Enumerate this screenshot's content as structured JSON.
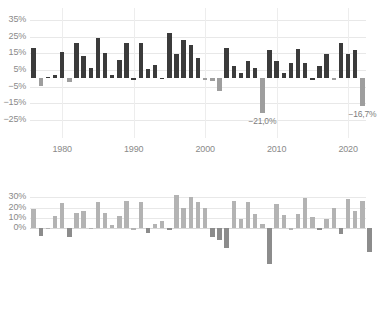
{
  "chart_data": [
    {
      "id": "top",
      "type": "bar",
      "title": "",
      "xlabel": "",
      "ylabel": "",
      "ylim": [
        -25,
        35
      ],
      "grid": true,
      "legend": null,
      "yticks": [
        "35%",
        "25%",
        "15%",
        "5%",
        "-5%",
        "-15%",
        "-25%"
      ],
      "ytick_values": [
        35,
        25,
        15,
        5,
        -5,
        -15,
        -25
      ],
      "xticks": [
        "1980",
        "1990",
        "2000",
        "2010",
        "2020"
      ],
      "xtick_values": [
        1980,
        1990,
        2000,
        2010,
        2020
      ],
      "positive_color": "#3b3b3b",
      "negative_color": "#9e9e9e",
      "categories": [
        1976,
        1977,
        1978,
        1979,
        1980,
        1981,
        1982,
        1983,
        1984,
        1985,
        1986,
        1987,
        1988,
        1989,
        1990,
        1991,
        1992,
        1993,
        1994,
        1995,
        1996,
        1997,
        1998,
        1999,
        2000,
        2001,
        2002,
        2003,
        2004,
        2005,
        2006,
        2007,
        2008,
        2009,
        2010,
        2011,
        2012,
        2013,
        2014,
        2015,
        2016,
        2017,
        2018,
        2019,
        2020,
        2021,
        2022
      ],
      "values": [
        18.0,
        -4.5,
        1.0,
        2.0,
        16.0,
        -2.5,
        21.5,
        13.5,
        6.5,
        24.5,
        15.0,
        2.0,
        11.0,
        21.5,
        0.0,
        21.5,
        5.5,
        8.0,
        0.5,
        27.5,
        14.5,
        23.0,
        20.0,
        12.0,
        -0.5,
        -1.5,
        -7.5,
        18.0,
        7.5,
        3.5,
        10.5,
        6.0,
        -21.0,
        17.0,
        10.5,
        3.5,
        9.5,
        17.5,
        9.5,
        0.0,
        7.5,
        14.5,
        -0.5,
        21.5,
        14.5,
        17.0,
        -16.7
      ],
      "annotations": [
        {
          "text": "-21,0%",
          "category": 2008,
          "value": -21.0
        },
        {
          "text": "-16,7%",
          "category": 2022,
          "value": -16.7
        }
      ]
    },
    {
      "id": "bottom",
      "type": "bar",
      "title": "",
      "xlabel": "",
      "ylabel": "",
      "ylim": [
        -40,
        35
      ],
      "grid": true,
      "legend": null,
      "yticks": [
        "30%",
        "20%",
        "10%",
        "0%"
      ],
      "ytick_values": [
        30,
        20,
        10,
        0
      ],
      "xticks": [],
      "xtick_values": [],
      "positive_color": "#b3b3b3",
      "negative_color": "#8c8c8c",
      "categories": [
        1976,
        1977,
        1978,
        1979,
        1980,
        1981,
        1982,
        1983,
        1984,
        1985,
        1986,
        1987,
        1988,
        1989,
        1990,
        1991,
        1992,
        1993,
        1994,
        1995,
        1996,
        1997,
        1998,
        1999,
        2000,
        2001,
        2002,
        2003,
        2004,
        2005,
        2006,
        2007,
        2008,
        2009,
        2010,
        2011,
        2012,
        2013,
        2014,
        2015,
        2016,
        2017,
        2018,
        2019,
        2020,
        2021,
        2022
      ],
      "values": [
        19.0,
        -7.5,
        0.5,
        11.5,
        24.5,
        -8.0,
        15.0,
        16.5,
        0.5,
        25.5,
        14.5,
        3.0,
        11.5,
        26.5,
        0.0,
        25.0,
        -4.5,
        4.5,
        7.0,
        -0.5,
        32.0,
        20.0,
        30.0,
        25.5,
        19.5,
        -8.0,
        -11.0,
        -19.0,
        26.0,
        9.0,
        25.0,
        13.5,
        4.0,
        -34.0,
        23.0,
        12.5,
        0.0,
        13.5,
        29.0,
        11.0,
        -0.5,
        9.5,
        19.5,
        -5.5,
        28.0,
        16.5,
        26.5,
        -23.0
      ]
    }
  ]
}
